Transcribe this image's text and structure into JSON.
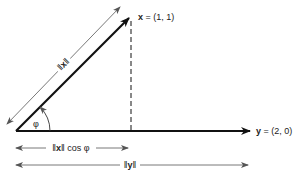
{
  "diagram": {
    "type": "vector-projection",
    "vector_x": {
      "label_name": "x",
      "label_eq": " = (1, 1)",
      "coords": [
        1,
        1
      ]
    },
    "vector_y": {
      "label_name": "y",
      "label_eq": " = (2, 0)",
      "coords": [
        2,
        0
      ]
    },
    "angle_label": "φ",
    "norm_x_label": {
      "left": "‖",
      "name": "x",
      "right": "‖"
    },
    "projection_label": {
      "left": "‖",
      "name": "x",
      "right": "‖ cos φ"
    },
    "norm_y_label": {
      "left": "‖",
      "name": "y",
      "right": "‖"
    },
    "colors": {
      "line": "#111111",
      "thin": "#555555",
      "background": "#ffffff"
    }
  }
}
